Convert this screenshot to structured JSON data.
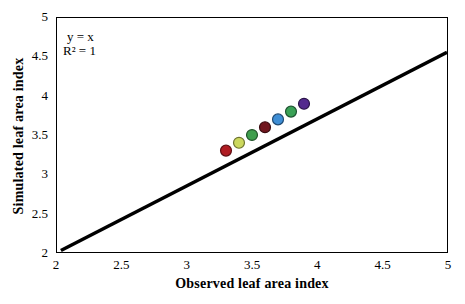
{
  "chart_data": {
    "type": "scatter",
    "title": "",
    "xlabel": "Observed leaf area index",
    "ylabel": "Simulated leaf area index",
    "xlim": [
      2,
      5
    ],
    "ylim": [
      2,
      5
    ],
    "grid": false,
    "legend": "none",
    "x_ticks": [
      {
        "v": 2,
        "label": "2"
      },
      {
        "v": 2.5,
        "label": "2.5"
      },
      {
        "v": 3,
        "label": "3"
      },
      {
        "v": 3.5,
        "label": "3.5"
      },
      {
        "v": 4,
        "label": "4"
      },
      {
        "v": 4.5,
        "label": "4.5"
      },
      {
        "v": 5,
        "label": "5"
      }
    ],
    "y_ticks": [
      {
        "v": 2,
        "label": "2"
      },
      {
        "v": 2.5,
        "label": "2.5"
      },
      {
        "v": 3,
        "label": "3"
      },
      {
        "v": 3.5,
        "label": "3.5"
      },
      {
        "v": 4,
        "label": "4"
      },
      {
        "v": 4.5,
        "label": "4.5"
      },
      {
        "v": 5,
        "label": "5"
      }
    ],
    "annotation": {
      "line1": "y = x",
      "line2": "R² = 1"
    },
    "identity_line": {
      "x1": 2.03,
      "y1": 2.02,
      "x2": 5.0,
      "y2": 4.56,
      "color": "#000000",
      "stroke_width": 3.5
    },
    "points": [
      {
        "x": 3.3,
        "y": 3.3,
        "color": "#b01c22",
        "stroke": "#5f0e12"
      },
      {
        "x": 3.4,
        "y": 3.4,
        "color": "#ccd85e",
        "stroke": "#6e7430"
      },
      {
        "x": 3.5,
        "y": 3.5,
        "color": "#3f9e4d",
        "stroke": "#1f5228"
      },
      {
        "x": 3.6,
        "y": 3.6,
        "color": "#70161e",
        "stroke": "#380a0f"
      },
      {
        "x": 3.7,
        "y": 3.7,
        "color": "#3f8ed5",
        "stroke": "#1f4a73"
      },
      {
        "x": 3.8,
        "y": 3.8,
        "color": "#3aa156",
        "stroke": "#1d5330"
      },
      {
        "x": 3.9,
        "y": 3.9,
        "color": "#542a8e",
        "stroke": "#2b1549"
      }
    ],
    "point_radius": 5.5,
    "point_stroke_width": 1.2
  }
}
